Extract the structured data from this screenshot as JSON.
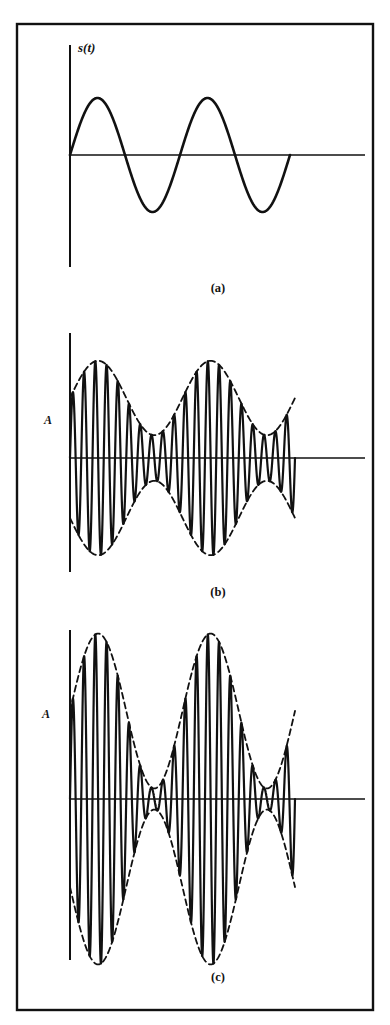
{
  "figure": {
    "background_color": "#ffffff",
    "ink_color": "#111111",
    "border": {
      "x": 17,
      "y": 24,
      "width": 356,
      "height": 986,
      "stroke_width": 2.4,
      "name": "figure-outer-border"
    },
    "caption_a": "(a)",
    "caption_b": "(b)",
    "caption_c": "(c)",
    "signal_label": "s(t)",
    "amplitude_label_b": "A",
    "amplitude_label_c": "A"
  },
  "chart_data": [
    {
      "type": "line",
      "id": "panel-a",
      "title": "(a)",
      "ylabel": "s(t)",
      "xlabel": "",
      "description": "Baseband modulating sinusoid s(t)",
      "axes": {
        "origin_x": 70,
        "origin_y": 155,
        "x_axis_start": 70,
        "x_axis_end": 365,
        "y_axis_top": 45,
        "y_axis_bottom": 267,
        "grid": false,
        "legend": "none"
      },
      "curve": {
        "form": "sine",
        "amplitude": 57,
        "cycles": 2.0,
        "phase_deg": 0,
        "x_start": 70,
        "x_end": 290,
        "stroke_width": 2.6
      },
      "x": [
        0,
        0.125,
        0.25,
        0.375,
        0.5,
        0.625,
        0.75,
        0.875,
        1.0
      ],
      "values": [
        0,
        0.707,
        1.0,
        0.707,
        0,
        -0.707,
        -1.0,
        -0.707,
        0
      ],
      "ylim": [
        -1,
        1
      ]
    },
    {
      "type": "line",
      "id": "panel-b",
      "title": "(b)",
      "ylabel": "A",
      "xlabel": "",
      "description": "Amplitude modulated carrier, modulation index below 1 (envelope stays above zero)",
      "axes": {
        "origin_x": 70,
        "origin_y": 458,
        "x_axis_start": 70,
        "x_axis_end": 365,
        "y_axis_top": 333,
        "y_axis_bottom": 572,
        "grid": false,
        "legend": "none"
      },
      "carrier": {
        "cycles": 20,
        "x_start": 70,
        "x_end": 295,
        "stroke_width": 2.2
      },
      "envelope": {
        "carrier_amplitude_px": 60,
        "modulation_index": 0.62,
        "modulation_cycles": 2.0,
        "modulation_phase_deg": 0,
        "dash_pattern": "6,4",
        "stroke_width": 1.8,
        "min_px": 23,
        "max_px": 97
      },
      "ylim": [
        -1,
        1
      ]
    },
    {
      "type": "line",
      "id": "panel-c",
      "title": "(c)",
      "ylabel": "A",
      "xlabel": "",
      "description": "Amplitude modulated carrier, larger modulation index (envelope nearly collapses to zero)",
      "axes": {
        "origin_x": 70,
        "origin_y": 799,
        "x_axis_start": 70,
        "x_axis_end": 365,
        "y_axis_top": 630,
        "y_axis_bottom": 960,
        "grid": false,
        "legend": "none"
      },
      "carrier": {
        "cycles": 20,
        "x_start": 70,
        "x_end": 295,
        "stroke_width": 2.2
      },
      "envelope": {
        "carrier_amplitude_px": 88,
        "modulation_index": 0.88,
        "modulation_cycles": 2.0,
        "modulation_phase_deg": 0,
        "dash_pattern": "6,4",
        "stroke_width": 1.8,
        "min_px": 11,
        "max_px": 165
      },
      "ylim": [
        -1,
        1
      ]
    }
  ],
  "captions": {
    "a": {
      "text": "(a)",
      "x": 218,
      "y": 292
    },
    "b": {
      "text": "(b)",
      "x": 218,
      "y": 596
    },
    "c": {
      "text": "(c)",
      "x": 218,
      "y": 981
    }
  },
  "labels": {
    "signal": {
      "text": "s(t)",
      "x": 78,
      "y": 52
    },
    "amp_b": {
      "text": "A",
      "x": 48,
      "y": 424
    },
    "amp_c": {
      "text": "A",
      "x": 46,
      "y": 718
    }
  }
}
